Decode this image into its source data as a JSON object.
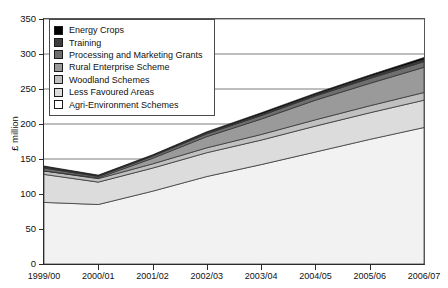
{
  "chart_data": {
    "type": "area",
    "stacked": true,
    "title": "",
    "subtitle": "",
    "xlabel": "",
    "ylabel": "£ million",
    "categories": [
      "1999/00",
      "2000/01",
      "2001/02",
      "2002/03",
      "2003/04",
      "2004/05",
      "2005/06",
      "2006/07"
    ],
    "ylim": [
      0,
      350
    ],
    "yticks": [
      0,
      50,
      100,
      150,
      200,
      250,
      300,
      350
    ],
    "grid": true,
    "grid_axis": "y",
    "legend_position": "top-left",
    "series": [
      {
        "name": "Agri-Environment Schemes",
        "color": "#f2f2f2",
        "values": [
          88,
          85,
          104,
          125,
          142,
          160,
          178,
          195
        ]
      },
      {
        "name": "Less Favoured Areas",
        "color": "#dcdcdc",
        "values": [
          40,
          32,
          33,
          34,
          35,
          37,
          38,
          39
        ]
      },
      {
        "name": "Woodland Schemes",
        "color": "#c0c0c0",
        "values": [
          5,
          5,
          6,
          7,
          8,
          9,
          10,
          11
        ]
      },
      {
        "name": "Rural Enterprise Scheme",
        "color": "#9a9a9a",
        "values": [
          0,
          1,
          8,
          16,
          22,
          28,
          32,
          36
        ]
      },
      {
        "name": "Processing and Marketing Grants",
        "color": "#6e6e6e",
        "values": [
          4,
          2,
          3,
          4,
          5,
          6,
          7,
          8
        ]
      },
      {
        "name": "Training",
        "color": "#3d3d3d",
        "values": [
          2,
          1,
          1,
          2,
          2,
          2,
          3,
          3
        ]
      },
      {
        "name": "Energy Crops",
        "color": "#000000",
        "values": [
          1,
          1,
          1,
          1,
          2,
          2,
          2,
          3
        ]
      }
    ],
    "totals": [
      140,
      127,
      156,
      189,
      216,
      244,
      270,
      295
    ]
  },
  "legend": {
    "items": [
      {
        "label": "Energy Crops",
        "color": "#000000"
      },
      {
        "label": "Training",
        "color": "#3d3d3d"
      },
      {
        "label": "Processing and Marketing Grants",
        "color": "#6e6e6e"
      },
      {
        "label": "Rural Enterprise Scheme",
        "color": "#9a9a9a"
      },
      {
        "label": "Woodland Schemes",
        "color": "#c0c0c0"
      },
      {
        "label": "Less Favoured Areas",
        "color": "#dcdcdc"
      },
      {
        "label": "Agri-Environment Schemes",
        "color": "#ffffff"
      }
    ]
  },
  "axes": {
    "y_title": "£ million",
    "y_labels": [
      "350",
      "300",
      "250",
      "200",
      "150",
      "100",
      "50",
      "0"
    ],
    "x_labels": [
      "1999/00",
      "2000/01",
      "2001/02",
      "2002/03",
      "2003/04",
      "2004/05",
      "2005/06",
      "2006/07"
    ]
  }
}
